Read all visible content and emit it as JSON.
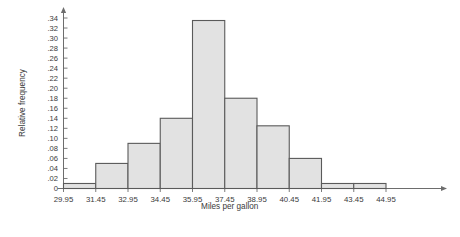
{
  "chart_data": {
    "type": "bar",
    "title": "",
    "subtitle": "",
    "xlabel": "Miles per gallon",
    "ylabel": "Relative frequency",
    "grid": false,
    "legend": null,
    "xlim": [
      29.95,
      44.95
    ],
    "ylim": [
      0,
      0.35
    ],
    "bin_width": 1.5,
    "bin_edges": [
      29.95,
      31.45,
      32.95,
      34.45,
      35.95,
      37.45,
      38.95,
      40.45,
      41.95,
      43.45,
      44.95
    ],
    "x_tick_labels": [
      "29.95",
      "31.45",
      "32.95",
      "34.45",
      "35.95",
      "37.45",
      "38.95",
      "40.45",
      "41.95",
      "43.45",
      "44.95"
    ],
    "y_tick_labels": [
      "0",
      ".02",
      ".04",
      ".06",
      ".08",
      ".10",
      ".12",
      ".14",
      ".16",
      ".18",
      ".20",
      ".22",
      ".24",
      ".26",
      ".28",
      ".30",
      ".32",
      ".34"
    ],
    "y_tick_values": [
      0,
      0.02,
      0.04,
      0.06,
      0.08,
      0.1,
      0.12,
      0.14,
      0.16,
      0.18,
      0.2,
      0.22,
      0.24,
      0.26,
      0.28,
      0.3,
      0.32,
      0.34
    ],
    "categories": [
      "29.95-31.45",
      "31.45-32.95",
      "32.95-34.45",
      "34.45-35.95",
      "35.95-37.45",
      "37.45-38.95",
      "38.95-40.45",
      "40.45-41.95",
      "41.95-43.45",
      "43.45-44.95"
    ],
    "values": [
      0.01,
      0.05,
      0.09,
      0.14,
      0.335,
      0.18,
      0.125,
      0.06,
      0.01,
      0.01
    ],
    "bar_fill_color": "#e2e2e2",
    "bar_edge_color": "#5a5a5a",
    "axis_color": "#6d6d6d"
  }
}
